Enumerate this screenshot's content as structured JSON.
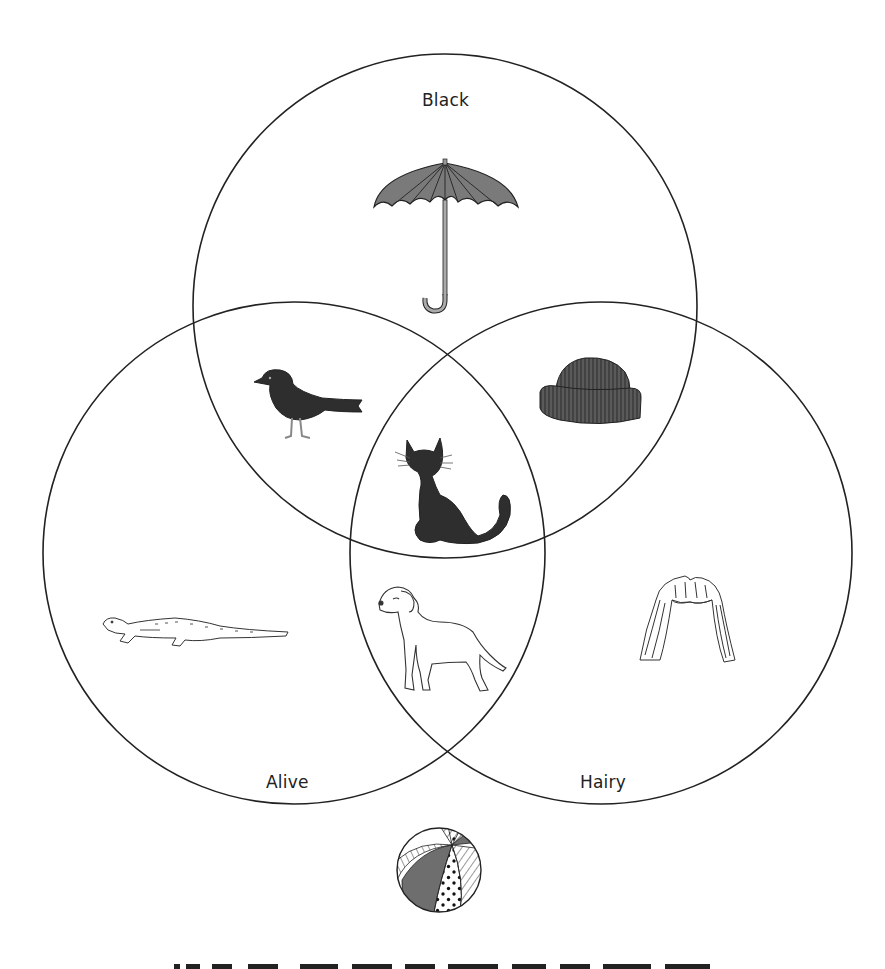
{
  "diagram": {
    "type": "venn",
    "sets": [
      {
        "name": "Black",
        "cx": 445,
        "cy": 306,
        "r": 252
      },
      {
        "name": "Alive",
        "cx": 294,
        "cy": 553,
        "r": 251
      },
      {
        "name": "Hairy",
        "cx": 601,
        "cy": 553,
        "r": 251
      }
    ],
    "labels": {
      "black": "Black",
      "alive": "Alive",
      "hairy": "Hairy"
    },
    "items": [
      {
        "name": "umbrella",
        "sets": [
          "Black"
        ]
      },
      {
        "name": "bird",
        "sets": [
          "Black",
          "Alive"
        ]
      },
      {
        "name": "hat",
        "sets": [
          "Black",
          "Hairy"
        ]
      },
      {
        "name": "cat",
        "sets": [
          "Black",
          "Alive",
          "Hairy"
        ]
      },
      {
        "name": "dog",
        "sets": [
          "Alive",
          "Hairy"
        ]
      },
      {
        "name": "lizard",
        "sets": [
          "Alive"
        ]
      },
      {
        "name": "wig",
        "sets": [
          "Hairy"
        ]
      },
      {
        "name": "beach-ball",
        "sets": []
      }
    ],
    "colors": {
      "stroke": "#222222",
      "fill_dark": "#2e2e2e",
      "fill_mid": "#6e6e6e",
      "background": "#ffffff"
    }
  }
}
